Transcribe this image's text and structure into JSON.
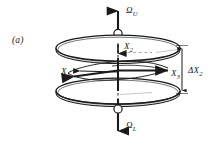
{
  "figure": {
    "panel_label": "(a)",
    "background_color": "#ffffff",
    "line_color": "#1a1a1a",
    "disk_fill": "#ffffff"
  },
  "labels": {
    "omega_upper": {
      "symbol": "Ω",
      "subscript": "U"
    },
    "omega_lower": {
      "symbol": "Ω",
      "subscript": "L"
    },
    "x1": {
      "symbol": "X",
      "subscript": "1"
    },
    "x2": {
      "symbol": "X",
      "subscript": "2"
    },
    "x3": {
      "symbol": "X",
      "subscript": "3"
    },
    "gap": {
      "symbol": "ΔX",
      "subscript": "2"
    }
  },
  "geometry": {
    "axis_x": 118,
    "upper_disk": {
      "cy": 48,
      "rx": 62,
      "ry": 13,
      "thickness": 3
    },
    "lower_disk": {
      "cy": 91,
      "rx": 62,
      "ry": 13,
      "thickness": 3
    },
    "dimension_line": {
      "x": 182,
      "y_top": 45,
      "y_bottom": 94
    },
    "axis_top_y": 8,
    "axis_bottom_y": 134
  }
}
